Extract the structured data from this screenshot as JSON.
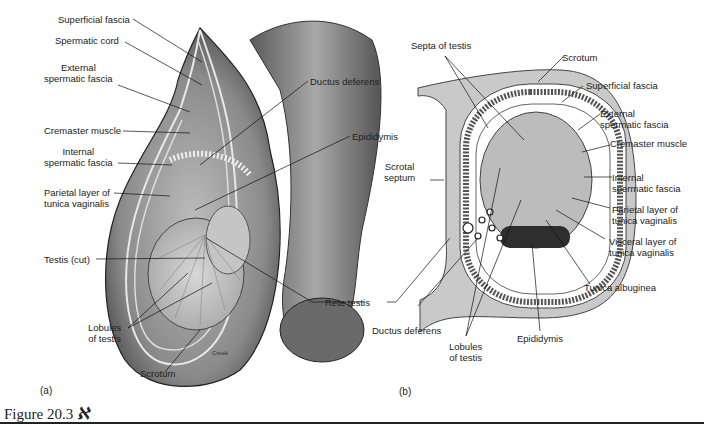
{
  "figure": {
    "title": "Figure 20.3",
    "icon": "art-icon",
    "panel_a_label": "(a)",
    "panel_b_label": "(b)",
    "credit": "Creek"
  },
  "panel_a": {
    "labels": [
      {
        "id": "superficial-fascia",
        "text": "Superficial fascia"
      },
      {
        "id": "spermatic-cord",
        "text": "Spermatic cord"
      },
      {
        "id": "external-spermatic-fascia",
        "text": "External\nspermatic fascia"
      },
      {
        "id": "cremaster-muscle",
        "text": "Cremaster muscle"
      },
      {
        "id": "internal-spermatic-fascia",
        "text": "Internal\nspermatic fascia"
      },
      {
        "id": "parietal-layer",
        "text": "Parietal layer of\ntunica vaginalis"
      },
      {
        "id": "testis-cut",
        "text": "Testis (cut)"
      },
      {
        "id": "lobules-of-testis",
        "text": "Lobules\nof testis"
      },
      {
        "id": "scrotum",
        "text": "Scrotum"
      },
      {
        "id": "ductus-deferens",
        "text": "Ductus deferens"
      },
      {
        "id": "epididymis",
        "text": "Epididymis"
      },
      {
        "id": "rete-testis",
        "text": "Rete testis"
      }
    ]
  },
  "panel_b": {
    "labels": [
      {
        "id": "septa-of-testis",
        "text": "Septa of testis"
      },
      {
        "id": "scrotum",
        "text": "Scrotum"
      },
      {
        "id": "superficial-fascia",
        "text": "Superficial fascia"
      },
      {
        "id": "external-spermatic-fascia",
        "text": "External\nspermatic fascia"
      },
      {
        "id": "cremaster-muscle",
        "text": "Cremaster muscle"
      },
      {
        "id": "scrotal-septum",
        "text": "Scrotal\nseptum"
      },
      {
        "id": "internal-spermatic-fascia",
        "text": "Internal\nspermatic fascia"
      },
      {
        "id": "parietal-layer",
        "text": "Parietal layer of\ntunica vaginalis"
      },
      {
        "id": "visceral-layer",
        "text": "Visceral layer of\ntunica vaginalis"
      },
      {
        "id": "tunica-albuginea",
        "text": "Tunica albuginea"
      },
      {
        "id": "ductus-deferens",
        "text": "Ductus deferens"
      },
      {
        "id": "lobules-of-testis",
        "text": "Lobules\nof testis"
      },
      {
        "id": "epididymis",
        "text": "Epididymis"
      }
    ]
  }
}
